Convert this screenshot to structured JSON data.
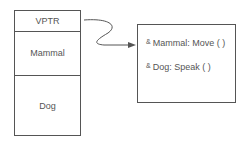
{
  "object_layout": {
    "rows": [
      {
        "label": "VPTR"
      },
      {
        "label": "Mammal"
      },
      {
        "label": "Dog"
      }
    ]
  },
  "vtable": {
    "entries": [
      {
        "prefix": "&",
        "label": "Mammal: Move ( )"
      },
      {
        "prefix": "&",
        "label": "Dog: Speak ( )"
      }
    ]
  },
  "colors": {
    "stroke": "#555555",
    "text": "#555555"
  }
}
